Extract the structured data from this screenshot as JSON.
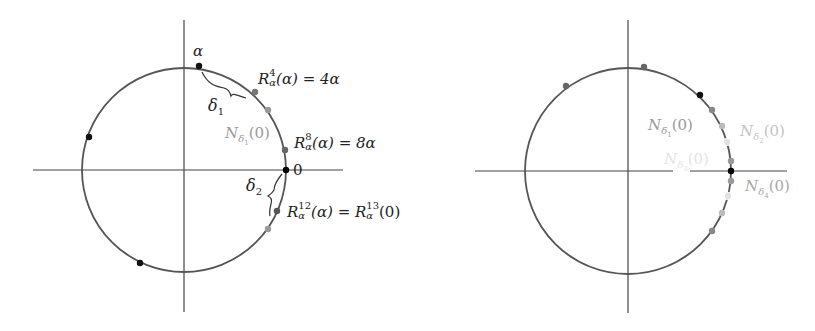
{
  "figure": {
    "panels": [
      {
        "id": "left",
        "axes": {
          "cx": 184,
          "cy": 170,
          "v": [
            20,
            312
          ],
          "h": [
            33,
            343
          ]
        },
        "circle": {
          "cx": 184,
          "cy": 170,
          "r": 102,
          "stroke": "#555555"
        },
        "points": [
          {
            "name": "alpha",
            "x": 199,
            "y": 66,
            "color": "#111111"
          },
          {
            "name": "R4",
            "x": 255,
            "y": 92,
            "color": "#777777"
          },
          {
            "name": "p5",
            "x": 268,
            "y": 110,
            "color": "#999999"
          },
          {
            "name": "R8",
            "x": 285,
            "y": 150,
            "color": "#666666"
          },
          {
            "name": "zero",
            "x": 286,
            "y": 170,
            "color": "#000000"
          },
          {
            "name": "R12",
            "x": 277,
            "y": 211,
            "color": "#555555"
          },
          {
            "name": "p13",
            "x": 268,
            "y": 229,
            "color": "#999999"
          },
          {
            "name": "p2",
            "x": 89,
            "y": 137,
            "color": "#111111"
          },
          {
            "name": "p3",
            "x": 140,
            "y": 263,
            "color": "#111111"
          }
        ],
        "braces": [
          {
            "name": "delta1-brace",
            "d": "M202 72 C 208 84, 214 86, 224 88 C 228 89, 230 92, 231 96 C 233 92, 238 96, 246 98"
          },
          {
            "name": "delta2-brace",
            "d": "M282 174 C 277 180, 274 186, 274 190 C 273 192, 271 194, 268 196 C 272 198, 272 200, 271 204 C 270 208, 269 212, 270 216"
          }
        ],
        "labels": {
          "alpha": "α",
          "delta1": "δ",
          "delta1_sub": "1",
          "R4_base": "R",
          "R4_sup": "4",
          "R4_sub": "α",
          "R4_rest": "(α) = 4α",
          "N_delta1": "N",
          "N_delta1_sub": "δ",
          "N_delta1_subsub": "1",
          "N_delta1_rest": "(0)",
          "R8_base": "R",
          "R8_sup": "8",
          "R8_sub": "α",
          "R8_rest": "(α) = 8α",
          "zero": "0",
          "delta2": "δ",
          "delta2_sub": "2",
          "R12_base": "R",
          "R12_sup": "12",
          "R12_sub": "α",
          "R12_mid": "(α) = ",
          "R13_base": "R",
          "R13_sup": "13",
          "R13_sub": "α",
          "R13_rest": "(0)"
        }
      },
      {
        "id": "right",
        "axes": {
          "cx": 628,
          "cy": 171,
          "v": [
            20,
            313
          ],
          "h": [
            475,
            787
          ]
        },
        "axis_gap": [
          673,
          690
        ],
        "circle": {
          "cx": 628,
          "cy": 171,
          "r": 103,
          "stroke": "#555555"
        },
        "points": [
          {
            "name": "p-top",
            "x": 644,
            "y": 67,
            "color": "#666666"
          },
          {
            "name": "p-left",
            "x": 566,
            "y": 86,
            "color": "#666666"
          },
          {
            "name": "p-black-upper",
            "x": 700,
            "y": 95,
            "color": "#111111"
          },
          {
            "name": "p-a",
            "x": 712,
            "y": 110,
            "color": "#888888"
          },
          {
            "name": "p-b",
            "x": 722,
            "y": 126,
            "color": "#bbbbbb"
          },
          {
            "name": "p-c",
            "x": 727,
            "y": 142,
            "color": "#e2e2e2"
          },
          {
            "name": "p-d",
            "x": 731,
            "y": 161,
            "color": "#999999"
          },
          {
            "name": "zero",
            "x": 731,
            "y": 171,
            "color": "#000000"
          },
          {
            "name": "p-e",
            "x": 731,
            "y": 181,
            "color": "#999999"
          },
          {
            "name": "p-f",
            "x": 728,
            "y": 196,
            "color": "#e2e2e2"
          },
          {
            "name": "p-g",
            "x": 722,
            "y": 213,
            "color": "#bbbbbb"
          },
          {
            "name": "p-h",
            "x": 712,
            "y": 231,
            "color": "#888888"
          }
        ],
        "labels": {
          "N1": "N",
          "N1_sub": "δ",
          "N1_subsub": "1",
          "N1_rest": "(0)",
          "N2": "N",
          "N2_sub": "δ",
          "N2_subsub": "2",
          "N2_rest": "(0)",
          "N3": "N",
          "N3_sub": "δ",
          "N3_subsub": "3",
          "N3_rest": "(0)",
          "N4": "N",
          "N4_sub": "δ",
          "N4_subsub": "4",
          "N4_rest": "(0)"
        }
      }
    ]
  }
}
